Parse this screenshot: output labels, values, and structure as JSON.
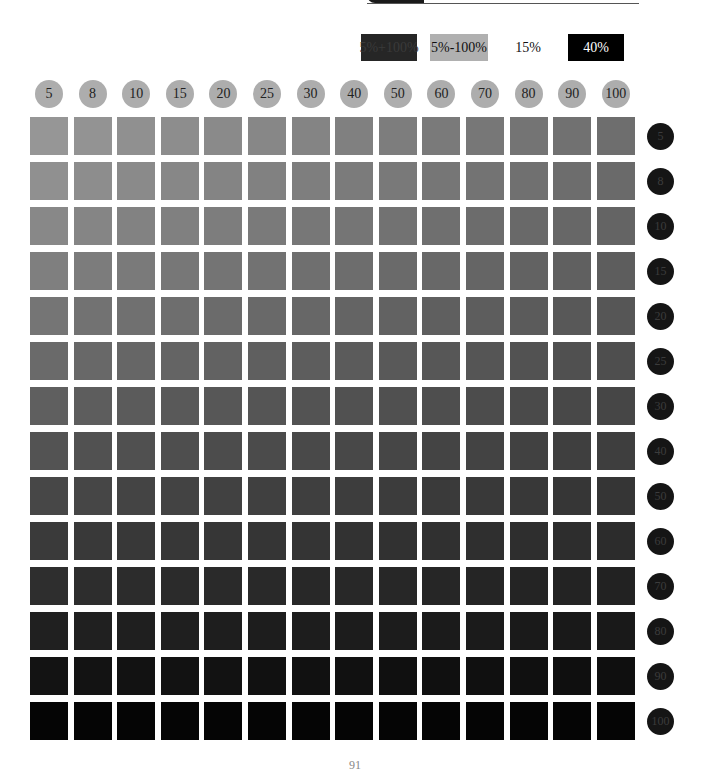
{
  "legend": [
    {
      "label": "5%+100%",
      "bg": "#262626",
      "fg": "#3a3a3a"
    },
    {
      "label": "5%-100%",
      "bg": "#b0b0b0",
      "fg": "#111111"
    },
    {
      "label": "15%",
      "bg": "#ffffff",
      "fg": "#111111"
    },
    {
      "label": "40%",
      "bg": "#000000",
      "fg": "#ffffff"
    }
  ],
  "columns": [
    "5",
    "8",
    "10",
    "15",
    "20",
    "25",
    "30",
    "40",
    "50",
    "60",
    "70",
    "80",
    "90",
    "100"
  ],
  "rows": [
    "5",
    "8",
    "10",
    "15",
    "20",
    "25",
    "30",
    "40",
    "50",
    "60",
    "70",
    "80",
    "90",
    "100"
  ],
  "grid": {
    "start_x": 30,
    "start_y": 117,
    "pitch_x": 43.6,
    "pitch_y": 45,
    "cell_size": 38,
    "lightest": "#959595",
    "darkest": "#000000"
  },
  "page_number": "91"
}
